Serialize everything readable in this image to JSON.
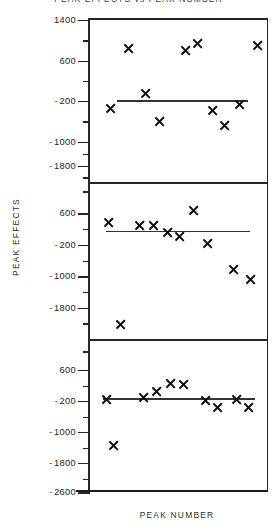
{
  "figure": {
    "title": "PEAK EFFECTS vs PEAK NUMBER",
    "y_axis_title": "PEAK EFFECTS",
    "x_axis_title": "PEAK NUMBER"
  },
  "chart_data": {
    "type": "scatter",
    "title": "PEAK EFFECTS vs PEAK NUMBER",
    "xlabel": "PEAK NUMBER",
    "ylabel": "PEAK EFFECTS",
    "grid": false,
    "legend": false,
    "marker": "x",
    "layout": "3 stacked panels sharing one frame, common x-axis",
    "panels": [
      {
        "index": 1,
        "ylim": [
          -2600,
          1400
        ],
        "yticks": [
          1400,
          600,
          -200,
          -1000,
          -1800
        ],
        "ytick_labels": [
          "1400",
          "-200",
          "-600",
          "-1000",
          "-1800"
        ],
        "minor_ticks": true,
        "x": [
          1,
          2,
          3,
          4,
          5,
          6,
          7,
          8,
          9,
          10
        ],
        "values": [
          -220,
          880,
          120,
          -420,
          850,
          1000,
          -250,
          -560,
          -60,
          930
        ],
        "trend_line": {
          "y": 60,
          "x_start": 1.5,
          "x_end": 9.4
        }
      },
      {
        "index": 2,
        "ylim": [
          -2600,
          1000
        ],
        "yticks": [
          600,
          -200,
          -1000,
          -1800
        ],
        "ytick_labels": [
          "600",
          "-200",
          "-1000",
          "-1800"
        ],
        "minor_ticks": true,
        "x": [
          1,
          2,
          3,
          4,
          5,
          6,
          7,
          8,
          9,
          10
        ],
        "values": [
          140,
          -2050,
          80,
          60,
          -140,
          720,
          -250,
          -520,
          -1180,
          -1500
        ],
        "trend_line": {
          "y": -60,
          "x_start": 1.3,
          "x_end": 9.5
        }
      },
      {
        "index": 3,
        "ylim": [
          -2600,
          1000
        ],
        "yticks": [
          600,
          -200,
          -1000,
          -1800,
          -2600
        ],
        "ytick_labels": [
          "600",
          "-200",
          "-1000",
          "-1800",
          "-2600"
        ],
        "minor_ticks": true,
        "x": [
          1,
          2,
          3,
          4,
          5,
          6,
          7,
          8,
          9,
          10
        ],
        "values": [
          -60,
          -1350,
          20,
          170,
          390,
          360,
          -80,
          -330,
          -70,
          -320
        ],
        "trend_line": {
          "y": 0,
          "x_start": 1.2,
          "x_end": 9.6
        }
      }
    ]
  },
  "panels": [
    {
      "ticks": [
        {
          "label": "1400",
          "negative": false,
          "pos": 0.0,
          "major": true
        },
        {
          "label": "",
          "negative": false,
          "pos": 0.125,
          "major": false
        },
        {
          "label": "600",
          "negative": false,
          "pos": 0.25,
          "major": true
        },
        {
          "label": "",
          "negative": false,
          "pos": 0.375,
          "major": false
        },
        {
          "label": "200",
          "negative": true,
          "pos": 0.5,
          "major": true
        },
        {
          "label": "",
          "negative": false,
          "pos": 0.625,
          "major": false
        },
        {
          "label": "1000",
          "negative": true,
          "pos": 0.75,
          "major": true
        },
        {
          "label": "",
          "negative": false,
          "pos": 0.825,
          "major": false
        },
        {
          "label": "1800",
          "negative": true,
          "pos": 0.9,
          "major": true
        },
        {
          "label": "",
          "negative": false,
          "pos": 0.97,
          "major": false
        }
      ],
      "markers": [
        {
          "x": 0.115,
          "y": 0.545
        },
        {
          "x": 0.215,
          "y": 0.175
        },
        {
          "x": 0.315,
          "y": 0.455
        },
        {
          "x": 0.395,
          "y": 0.625
        },
        {
          "x": 0.54,
          "y": 0.188
        },
        {
          "x": 0.605,
          "y": 0.145
        },
        {
          "x": 0.69,
          "y": 0.56
        },
        {
          "x": 0.76,
          "y": 0.65
        },
        {
          "x": 0.845,
          "y": 0.52
        },
        {
          "x": 0.945,
          "y": 0.16
        }
      ],
      "trend": {
        "left": 0.155,
        "right": 0.895,
        "y": 0.495
      }
    },
    {
      "ticks": [
        {
          "label": "",
          "negative": false,
          "pos": 0.06,
          "major": false
        },
        {
          "label": "600",
          "negative": false,
          "pos": 0.2,
          "major": true
        },
        {
          "label": "",
          "negative": false,
          "pos": 0.3,
          "major": false
        },
        {
          "label": "200",
          "negative": true,
          "pos": 0.4,
          "major": true
        },
        {
          "label": "",
          "negative": false,
          "pos": 0.5,
          "major": false
        },
        {
          "label": "1000",
          "negative": true,
          "pos": 0.6,
          "major": true
        },
        {
          "label": "",
          "negative": false,
          "pos": 0.7,
          "major": false
        },
        {
          "label": "1800",
          "negative": true,
          "pos": 0.8,
          "major": true
        },
        {
          "label": "",
          "negative": false,
          "pos": 0.9,
          "major": false
        }
      ],
      "markers": [
        {
          "x": 0.105,
          "y": 0.255
        },
        {
          "x": 0.175,
          "y": 0.905
        },
        {
          "x": 0.28,
          "y": 0.275
        },
        {
          "x": 0.36,
          "y": 0.28
        },
        {
          "x": 0.44,
          "y": 0.32
        },
        {
          "x": 0.505,
          "y": 0.345
        },
        {
          "x": 0.585,
          "y": 0.18
        },
        {
          "x": 0.665,
          "y": 0.39
        },
        {
          "x": 0.81,
          "y": 0.56
        },
        {
          "x": 0.905,
          "y": 0.62
        }
      ],
      "trend": {
        "left": 0.09,
        "right": 0.905,
        "y": 0.31
      }
    },
    {
      "ticks": [
        {
          "label": "",
          "negative": false,
          "pos": 0.08,
          "major": false
        },
        {
          "label": "600",
          "negative": false,
          "pos": 0.2,
          "major": true
        },
        {
          "label": "",
          "negative": false,
          "pos": 0.3,
          "major": false
        },
        {
          "label": "200",
          "negative": true,
          "pos": 0.4,
          "major": true
        },
        {
          "label": "",
          "negative": false,
          "pos": 0.5,
          "major": false
        },
        {
          "label": "1000",
          "negative": true,
          "pos": 0.6,
          "major": true
        },
        {
          "label": "",
          "negative": false,
          "pos": 0.7,
          "major": false
        },
        {
          "label": "1800",
          "negative": true,
          "pos": 0.8,
          "major": true
        },
        {
          "label": "",
          "negative": false,
          "pos": 0.9,
          "major": false
        },
        {
          "label": "2600",
          "negative": true,
          "pos": 0.99,
          "major": true
        }
      ],
      "markers": [
        {
          "x": 0.095,
          "y": 0.39
        },
        {
          "x": 0.135,
          "y": 0.69
        },
        {
          "x": 0.3,
          "y": 0.38
        },
        {
          "x": 0.375,
          "y": 0.34
        },
        {
          "x": 0.455,
          "y": 0.29
        },
        {
          "x": 0.53,
          "y": 0.295
        },
        {
          "x": 0.65,
          "y": 0.395
        },
        {
          "x": 0.72,
          "y": 0.44
        },
        {
          "x": 0.825,
          "y": 0.39
        },
        {
          "x": 0.895,
          "y": 0.44
        }
      ],
      "trend": {
        "left": 0.075,
        "right": 0.93,
        "y": 0.383
      }
    }
  ]
}
